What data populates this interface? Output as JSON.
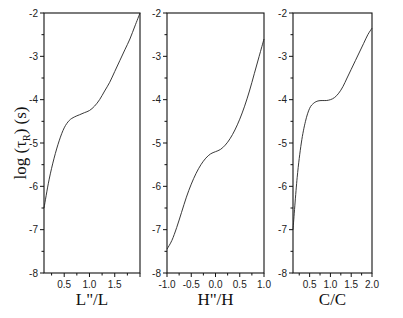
{
  "ylabel": {
    "prefix": "log (",
    "tau": "τ",
    "sub": "R",
    "suffix": ") (s)"
  },
  "chart_data": [
    {
      "type": "line",
      "panel": 1,
      "xlabel": "L\"/L",
      "ylabel": "log(τR) (s)",
      "xlim": [
        0.1,
        2.0
      ],
      "ylim": [
        -8,
        -2
      ],
      "xticks": [
        0.5,
        1.0,
        1.5
      ],
      "xtick_labels": [
        "0.5",
        "1.0",
        "1.5"
      ],
      "yticks": [
        -8,
        -7,
        -6,
        -5,
        -4,
        -3,
        -2
      ],
      "ytick_labels": [
        "-8",
        "-7",
        "-6",
        "-5",
        "-4",
        "-3",
        "-2"
      ],
      "grid": false,
      "series": [
        {
          "name": "curve",
          "x": [
            0.1,
            0.2,
            0.3,
            0.4,
            0.5,
            0.6,
            0.7,
            0.8,
            0.9,
            1.0,
            1.1,
            1.2,
            1.3,
            1.4,
            1.5,
            1.6,
            1.7,
            1.8,
            1.9,
            2.0
          ],
          "y": [
            -6.5,
            -5.85,
            -5.35,
            -4.95,
            -4.65,
            -4.48,
            -4.4,
            -4.35,
            -4.3,
            -4.25,
            -4.15,
            -4.0,
            -3.8,
            -3.6,
            -3.35,
            -3.1,
            -2.85,
            -2.6,
            -2.3,
            -2.0
          ]
        }
      ]
    },
    {
      "type": "line",
      "panel": 2,
      "xlabel": "H\"/H",
      "ylabel": "",
      "xlim": [
        -1.0,
        1.0
      ],
      "ylim": [
        -8,
        -2
      ],
      "xticks": [
        -1.0,
        -0.5,
        0.0,
        0.5,
        1.0
      ],
      "xtick_labels": [
        "-1.0",
        "-0.5",
        "0.0",
        "0.5",
        "1.0"
      ],
      "yticks": [
        -8,
        -7,
        -6,
        -5,
        -4,
        -3,
        -2
      ],
      "ytick_labels": [
        "-8",
        "-7",
        "-6",
        "-5",
        "-4",
        "-3",
        "-2"
      ],
      "grid": false,
      "series": [
        {
          "name": "curve",
          "x": [
            -1.0,
            -0.9,
            -0.8,
            -0.7,
            -0.6,
            -0.5,
            -0.4,
            -0.3,
            -0.2,
            -0.1,
            0.0,
            0.1,
            0.2,
            0.3,
            0.4,
            0.5,
            0.6,
            0.7,
            0.8,
            0.9,
            1.0
          ],
          "y": [
            -7.45,
            -7.25,
            -6.95,
            -6.6,
            -6.25,
            -5.95,
            -5.7,
            -5.5,
            -5.35,
            -5.25,
            -5.2,
            -5.15,
            -5.05,
            -4.9,
            -4.7,
            -4.45,
            -4.15,
            -3.8,
            -3.4,
            -3.0,
            -2.6
          ]
        }
      ]
    },
    {
      "type": "line",
      "panel": 3,
      "xlabel": "C/C",
      "ylabel": "",
      "xlim": [
        0.1,
        2.0
      ],
      "ylim": [
        -8,
        -2
      ],
      "xticks": [
        0.5,
        1.0,
        1.5,
        2.0
      ],
      "xtick_labels": [
        "0.5",
        "1.0",
        "1.5",
        "2.0"
      ],
      "yticks": [
        -8,
        -7,
        -6,
        -5,
        -4,
        -3,
        -2
      ],
      "ytick_labels": [
        "-8",
        "-7",
        "-6",
        "-5",
        "-4",
        "-3",
        "-2"
      ],
      "grid": false,
      "series": [
        {
          "name": "curve",
          "x": [
            0.1,
            0.2,
            0.3,
            0.4,
            0.5,
            0.6,
            0.7,
            0.8,
            0.9,
            1.0,
            1.1,
            1.2,
            1.3,
            1.4,
            1.5,
            1.6,
            1.7,
            1.8,
            1.9,
            2.0
          ],
          "y": [
            -7.0,
            -5.8,
            -5.0,
            -4.5,
            -4.2,
            -4.08,
            -4.03,
            -4.02,
            -4.02,
            -4.0,
            -3.95,
            -3.85,
            -3.7,
            -3.5,
            -3.3,
            -3.1,
            -2.9,
            -2.7,
            -2.5,
            -2.35
          ]
        }
      ]
    }
  ]
}
